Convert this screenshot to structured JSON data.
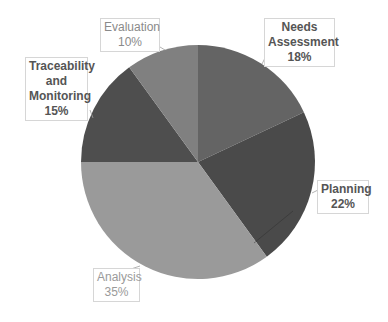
{
  "chart_data": {
    "type": "pie",
    "title": "",
    "start_angle_deg": 0,
    "direction": "clockwise",
    "center": [
      198,
      162
    ],
    "radius": 117,
    "legend": "none (data labels with callouts)",
    "slices": [
      {
        "label": "Needs Assessment",
        "value": 18,
        "value_label": "18%",
        "color": "#646464",
        "label_lines": [
          "Needs",
          "Assessment",
          "18%"
        ],
        "label_color": "#555555"
      },
      {
        "label": "Planning",
        "value": 22,
        "value_label": "22%",
        "color": "#4a4a4a",
        "label_lines": [
          "Planning",
          "22%"
        ],
        "label_color": "#555555"
      },
      {
        "label": "Analysis",
        "value": 35,
        "value_label": "35%",
        "color": "#9a9a9a",
        "label_lines": [
          "Analysis",
          "35%"
        ],
        "label_color": "#9a9a9a"
      },
      {
        "label": "Traceability and Monitoring",
        "value": 15,
        "value_label": "15%",
        "color": "#4e4e4e",
        "label_lines": [
          "Traceability",
          "and",
          "Monitoring",
          "15%"
        ],
        "label_color": "#555555"
      },
      {
        "label": "Evaluation",
        "value": 10,
        "value_label": "10%",
        "color": "#808080",
        "label_lines": [
          "Evaluation",
          "10%"
        ],
        "label_color": "#8a8a8a"
      }
    ]
  },
  "labels": {
    "needs_assessment": {
      "line1": "Needs",
      "line2": "Assessment",
      "line3": "18%"
    },
    "planning": {
      "line1": "Planning",
      "line2": "22%"
    },
    "analysis": {
      "line1": "Analysis",
      "line2": "35%"
    },
    "traceability": {
      "line1": "Traceability",
      "line2": "and",
      "line3": "Monitoring",
      "line4": "15%"
    },
    "evaluation": {
      "line1": "Evaluation",
      "line2": "10%"
    }
  }
}
